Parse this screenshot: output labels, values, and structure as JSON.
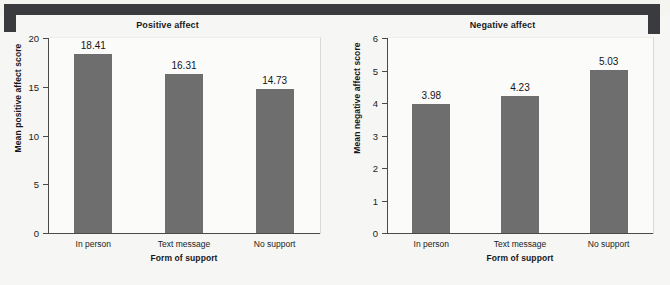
{
  "figure": {
    "background_color": "#f6f6f4",
    "scan_edge_color": "#3a3b3e",
    "bar_color": "#6e6e6e",
    "axis_color": "#4a4a4d"
  },
  "charts": [
    {
      "id": "positive-affect",
      "title": "Positive affect",
      "xlabel": "Form of support",
      "ylabel": "Mean positive affect score",
      "categories": [
        "In person",
        "Text message",
        "No support"
      ],
      "values": [
        18.41,
        16.31,
        14.73
      ],
      "value_labels": [
        "18.41",
        "16.31",
        "14.73"
      ],
      "yticks": [
        "0",
        "5",
        "10",
        "15",
        "20"
      ],
      "ymin": 0,
      "ymax": 20
    },
    {
      "id": "negative-affect",
      "title": "Negative affect",
      "xlabel": "Form of support",
      "ylabel": "Mean negative affect score",
      "categories": [
        "In person",
        "Text message",
        "No support"
      ],
      "values": [
        3.98,
        4.23,
        5.03
      ],
      "value_labels": [
        "3.98",
        "4.23",
        "5.03"
      ],
      "yticks": [
        "0",
        "1",
        "2",
        "3",
        "4",
        "5",
        "6"
      ],
      "ymin": 0,
      "ymax": 6
    }
  ],
  "chart_data": [
    {
      "type": "bar",
      "title": "Positive affect",
      "xlabel": "Form of support",
      "ylabel": "Mean positive affect score",
      "categories": [
        "In person",
        "Text message",
        "No support"
      ],
      "values": [
        18.41,
        16.31,
        14.73
      ],
      "ylim": [
        0,
        20
      ],
      "ytick_values": [
        0,
        5,
        10,
        15,
        20
      ],
      "grid": false,
      "legend": "none",
      "data_labels": [
        "18.41",
        "16.31",
        "14.73"
      ]
    },
    {
      "type": "bar",
      "title": "Negative affect",
      "xlabel": "Form of support",
      "ylabel": "Mean negative affect score",
      "categories": [
        "In person",
        "Text message",
        "No support"
      ],
      "values": [
        3.98,
        4.23,
        5.03
      ],
      "ylim": [
        0,
        6
      ],
      "ytick_values": [
        0,
        1,
        2,
        3,
        4,
        5,
        6
      ],
      "grid": false,
      "legend": "none",
      "data_labels": [
        "3.98",
        "4.23",
        "5.03"
      ]
    }
  ]
}
